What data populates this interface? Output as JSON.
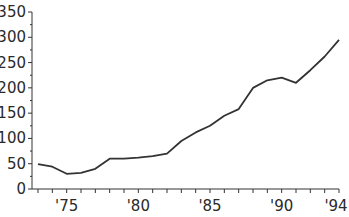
{
  "chart_data": {
    "type": "line",
    "title": "",
    "xlabel": "",
    "ylabel": "",
    "ylim": [
      0,
      350
    ],
    "xlim": [
      1973,
      1994
    ],
    "grid": false,
    "legend": null,
    "y_ticks": [
      0,
      50,
      100,
      150,
      200,
      250,
      300,
      350
    ],
    "y_tick_labels": [
      "0",
      "50",
      "100",
      "150",
      "200",
      "250",
      "300",
      "350"
    ],
    "x_ticks_labeled": [
      1975,
      1980,
      1985,
      1990,
      1994
    ],
    "x_tick_labels": [
      "'75",
      "'80",
      "'85",
      "'90",
      "'94"
    ],
    "x": [
      1973,
      1974,
      1975,
      1976,
      1977,
      1978,
      1979,
      1980,
      1981,
      1982,
      1983,
      1984,
      1985,
      1986,
      1987,
      1988,
      1989,
      1990,
      1991,
      1992,
      1993,
      1994
    ],
    "series": [
      {
        "name": "series-1",
        "color": "#333333",
        "values": [
          49,
          44,
          30,
          32,
          40,
          60,
          60,
          62,
          65,
          70,
          95,
          112,
          125,
          145,
          158,
          200,
          215,
          220,
          210,
          235,
          262,
          295
        ]
      }
    ]
  }
}
